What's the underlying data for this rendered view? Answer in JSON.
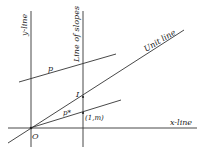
{
  "diagram": {
    "labels": {
      "y_line": "y-line",
      "line_of_slopes": "Line of slopes",
      "unit_line": "Unit line",
      "x_line": "x-line",
      "p": "p",
      "p_star": "p*",
      "I": "I",
      "point_1m": "(1,m)",
      "origin": "O"
    },
    "colors": {
      "line": "#333333",
      "background": "#ffffff"
    }
  }
}
